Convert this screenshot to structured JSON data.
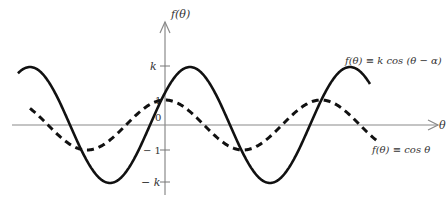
{
  "chart_data": {
    "type": "line",
    "title": "",
    "xlabel": "θ",
    "ylabel": "f(θ)",
    "yticks": [
      {
        "label": "k",
        "value": 1.75
      },
      {
        "label": "1",
        "value": 1
      },
      {
        "label": "0",
        "value": 0
      },
      {
        "label": "−1",
        "value": -1
      },
      {
        "label": "− k",
        "value": -1.75
      }
    ],
    "grid": false,
    "legend_position": "inline annotations right",
    "series": [
      {
        "name": "f(θ) = k cos (θ − α)",
        "style": "solid",
        "amplitude": "k",
        "phase_shift": "α",
        "x_pixels": [
          18,
          35,
          114,
          190,
          267,
          353,
          370
        ],
        "y_values": [
          1.5,
          1.75,
          -1.75,
          1.75,
          -1.75,
          1.75,
          1.1
        ]
      },
      {
        "name": "f(θ) = cos θ",
        "style": "dashed",
        "amplitude": 1,
        "phase_shift": 0,
        "x_pixels": [
          30,
          92,
          165,
          245,
          320,
          377
        ],
        "y_values": [
          0.6,
          -1,
          1,
          -1,
          1,
          -0.5
        ]
      }
    ]
  },
  "labels": {
    "y_axis": "f(θ)",
    "x_axis": "θ",
    "solid_curve": "f(θ) ≡ k cos (θ − α)",
    "dashed_curve": "f(θ) ≡ cos θ",
    "tick_k": "k",
    "tick_1": "1",
    "tick_0": "0",
    "tick_neg1": "− 1",
    "tick_negk": "− k"
  }
}
